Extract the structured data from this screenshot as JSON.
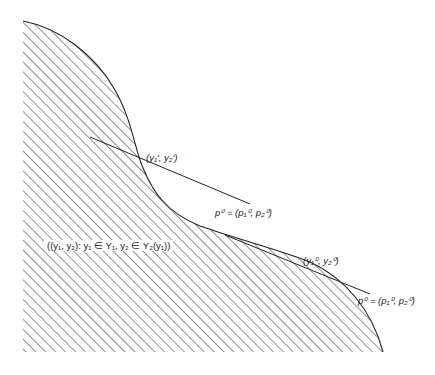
{
  "diagram": {
    "type": "production-possibility-set",
    "region_label": "((y₁, y₂): y₁ ∈ Y₁, y₂ ∈ Y₂(y₁))",
    "points": [
      {
        "name": "tangent-point-1",
        "label": "(y₁', y₂')",
        "x": 143,
        "y": 168
      },
      {
        "name": "tangent-point-2",
        "label": "(y₁⁰, y₂⁰)",
        "x": 308,
        "y": 262
      }
    ],
    "price_lines": [
      {
        "name": "price-line-1",
        "label": "p⁰ = (p₁⁰, p₂⁰)",
        "from": [
          90,
          137
        ],
        "to": [
          250,
          204
        ]
      },
      {
        "name": "price-line-2",
        "label": "p⁰ = (p₁⁰, p₂⁰)",
        "from": [
          225,
          235
        ],
        "to": [
          370,
          294
        ]
      }
    ],
    "colors": {
      "line": "#222222",
      "hatch": "#555555",
      "background": "#ffffff"
    }
  }
}
